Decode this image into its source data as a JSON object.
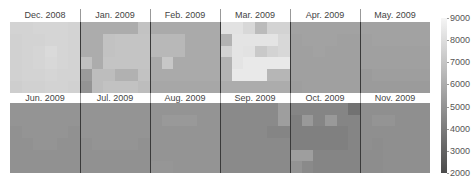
{
  "chart_data": {
    "type": "heatmap",
    "title": "",
    "layout": "small multiples, 2 rows x 6 columns, each panel a 6x6 grid",
    "colorbar": {
      "min": 2000,
      "max": 9000,
      "ticks": [
        9000,
        8000,
        7000,
        6000,
        5000,
        4000,
        3000,
        2000
      ],
      "colormap": "grayscale (dark = low, light = high)",
      "position": "right"
    },
    "panels": [
      {
        "label": "Dec. 2008",
        "values": [
          [
            7600,
            7600,
            7700,
            7700,
            7700,
            7600
          ],
          [
            7500,
            7600,
            7600,
            7700,
            7700,
            7600
          ],
          [
            7500,
            7600,
            7700,
            7900,
            7700,
            7600
          ],
          [
            7500,
            7600,
            7700,
            7800,
            7700,
            7600
          ],
          [
            7500,
            7600,
            7600,
            7700,
            7600,
            7600
          ],
          [
            7400,
            7500,
            7500,
            7600,
            7600,
            7500
          ]
        ]
      },
      {
        "label": "Jan. 2009",
        "values": [
          [
            6000,
            6000,
            6000,
            6000,
            6000,
            6900
          ],
          [
            6000,
            6000,
            6900,
            7000,
            7000,
            7000
          ],
          [
            6000,
            6000,
            6900,
            7000,
            7000,
            7000
          ],
          [
            6800,
            6000,
            7000,
            7000,
            7000,
            7000
          ],
          [
            5300,
            6700,
            6700,
            6200,
            6200,
            6900
          ],
          [
            5000,
            6700,
            6900,
            6900,
            6900,
            6700
          ]
        ]
      },
      {
        "label": "Feb. 2009",
        "values": [
          [
            5900,
            5900,
            5900,
            5900,
            5900,
            5900
          ],
          [
            6500,
            6500,
            6500,
            5900,
            5900,
            5900
          ],
          [
            6500,
            6500,
            6500,
            5900,
            5900,
            5900
          ],
          [
            5900,
            7100,
            5900,
            5900,
            5900,
            5900
          ],
          [
            5900,
            5900,
            5900,
            5900,
            5900,
            5900
          ],
          [
            5800,
            5800,
            5800,
            5800,
            5800,
            5800
          ]
        ]
      },
      {
        "label": "Mar. 2009",
        "values": [
          [
            8200,
            8200,
            7800,
            6600,
            7600,
            7600
          ],
          [
            6300,
            8300,
            8300,
            8300,
            8300,
            7800
          ],
          [
            7600,
            8300,
            8200,
            7200,
            7600,
            7800
          ],
          [
            6300,
            8300,
            8500,
            8500,
            8500,
            8500
          ],
          [
            6300,
            8500,
            8500,
            8500,
            6400,
            6400
          ],
          [
            6000,
            6000,
            6000,
            6000,
            6000,
            6000
          ]
        ]
      },
      {
        "label": "Apr. 2009",
        "values": [
          [
            5600,
            5600,
            5600,
            5600,
            5600,
            5600
          ],
          [
            5500,
            5600,
            5600,
            5600,
            5500,
            5500
          ],
          [
            5500,
            5500,
            5600,
            5500,
            5500,
            5500
          ],
          [
            5500,
            5500,
            5500,
            5500,
            5500,
            5500
          ],
          [
            5500,
            5500,
            5500,
            5500,
            5500,
            5500
          ],
          [
            5400,
            5500,
            5500,
            5500,
            5500,
            5500
          ]
        ]
      },
      {
        "label": "May. 2009",
        "values": [
          [
            5600,
            5600,
            5600,
            5600,
            5600,
            5600
          ],
          [
            5500,
            5600,
            5600,
            5600,
            5600,
            5600
          ],
          [
            5500,
            5500,
            5500,
            5500,
            5500,
            5500
          ],
          [
            5500,
            5500,
            5500,
            5500,
            5500,
            5500
          ],
          [
            5300,
            5400,
            5400,
            5400,
            5400,
            5400
          ],
          [
            5300,
            5300,
            5300,
            5300,
            5300,
            5300
          ]
        ]
      },
      {
        "label": "Jun. 2009",
        "values": [
          [
            5000,
            5000,
            5000,
            5000,
            5000,
            5000
          ],
          [
            5000,
            5000,
            5000,
            5000,
            5000,
            5000
          ],
          [
            4900,
            5000,
            5000,
            5000,
            5000,
            4900
          ],
          [
            4900,
            4900,
            5000,
            5000,
            4900,
            4900
          ],
          [
            4900,
            4900,
            4900,
            4900,
            4900,
            4900
          ],
          [
            4900,
            4900,
            4900,
            4900,
            4900,
            4900
          ]
        ]
      },
      {
        "label": "Jul. 2009",
        "values": [
          [
            5000,
            5000,
            5000,
            5000,
            5000,
            5000
          ],
          [
            5000,
            5000,
            5000,
            5000,
            5000,
            5000
          ],
          [
            5000,
            5000,
            5000,
            5000,
            5000,
            5000
          ],
          [
            4900,
            5000,
            5000,
            5000,
            5000,
            4900
          ],
          [
            4900,
            4900,
            4900,
            4900,
            4900,
            4900
          ],
          [
            4900,
            4900,
            4900,
            4900,
            4900,
            4900
          ]
        ]
      },
      {
        "label": "Aug. 2009",
        "values": [
          [
            5000,
            5000,
            5000,
            5000,
            5000,
            5000
          ],
          [
            5000,
            5200,
            5200,
            5200,
            5000,
            5000
          ],
          [
            5000,
            5000,
            5000,
            5000,
            5000,
            5000
          ],
          [
            5000,
            5000,
            5000,
            5000,
            5000,
            5000
          ],
          [
            5000,
            5000,
            5000,
            5000,
            5000,
            5000
          ],
          [
            5100,
            5100,
            5000,
            5000,
            5000,
            5000
          ]
        ]
      },
      {
        "label": "Sep. 2009",
        "values": [
          [
            4600,
            4600,
            4600,
            4600,
            4600,
            5400
          ],
          [
            4600,
            4600,
            4600,
            4600,
            4600,
            5400
          ],
          [
            4600,
            4600,
            4600,
            4600,
            4400,
            4400
          ],
          [
            4600,
            4600,
            4600,
            4600,
            4600,
            4600
          ],
          [
            4600,
            4600,
            4600,
            4600,
            4600,
            4600
          ],
          [
            4600,
            4600,
            4600,
            4600,
            4600,
            4600
          ]
        ]
      },
      {
        "label": "Oct. 2009",
        "values": [
          [
            4400,
            4400,
            4400,
            4400,
            4400,
            3600
          ],
          [
            4200,
            5200,
            4400,
            5200,
            4400,
            4400
          ],
          [
            4200,
            4200,
            4200,
            4200,
            4200,
            4400
          ],
          [
            4200,
            4200,
            4200,
            4200,
            4200,
            4400
          ],
          [
            5400,
            5400,
            4400,
            4400,
            4400,
            4400
          ],
          [
            5000,
            4600,
            4400,
            4400,
            4400,
            4400
          ]
        ]
      },
      {
        "label": "Nov. 2009",
        "values": [
          [
            4800,
            4800,
            4800,
            4800,
            4800,
            4800
          ],
          [
            4800,
            5000,
            5000,
            4800,
            4800,
            4800
          ],
          [
            4800,
            4800,
            4800,
            4800,
            4800,
            4800
          ],
          [
            4800,
            4700,
            4800,
            4800,
            4800,
            4800
          ],
          [
            4700,
            4700,
            4800,
            4800,
            4800,
            4800
          ],
          [
            4700,
            4700,
            4800,
            4800,
            4800,
            4800
          ]
        ]
      }
    ]
  }
}
